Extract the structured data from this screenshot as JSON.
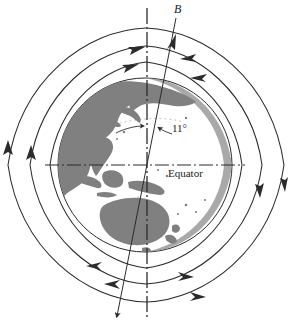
{
  "figure": {
    "labels": {
      "field_symbol": "B",
      "tilt_angle": "11°",
      "equator": "Equator"
    },
    "colors": {
      "land": "#808080",
      "ocean": "#ffffff",
      "line": "#2b2b2b",
      "background": "#ffffff",
      "terminator_shade": "#9a9a9a"
    },
    "geometry": {
      "globe_center_x": 145,
      "globe_center_y": 165,
      "globe_radius": 87,
      "rotation_axis_x": 147,
      "magnetic_axis_tilt_degrees": 11
    },
    "elements": {
      "rotation_axis_name": "rotation axis",
      "magnetic_axis_name": "magnetic dipole axis",
      "equator_line_name": "equator line",
      "field_line_count_per_side": 3,
      "field_direction": "out of south magnetic pole, into north magnetic pole"
    },
    "landmasses": [
      "Asia",
      "Japan",
      "Southeast Asia",
      "New Guinea",
      "Australia",
      "New Zealand"
    ]
  }
}
